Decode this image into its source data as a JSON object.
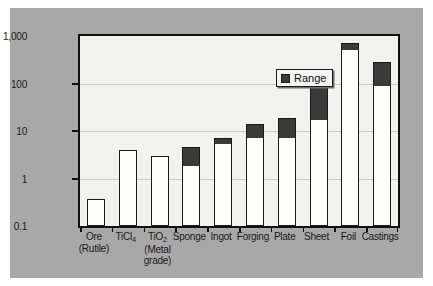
{
  "figure": {
    "background_color": "#a8a8a8",
    "plot_background_color": "#f2f2f0",
    "frame_color": "#111111"
  },
  "legend": {
    "label": "Range",
    "swatch_color": "#3a3a3a",
    "position": "top-center"
  },
  "chart_data": {
    "type": "bar",
    "title": "",
    "subtitle": "",
    "xlabel": "",
    "ylabel": "Log ($ per pound contained Ti)",
    "yscale": "log",
    "ylim": [
      0.1,
      1000
    ],
    "ytick_labels": [
      "1,000",
      "100",
      "10",
      "1",
      "0.1"
    ],
    "ytick_values": [
      1000,
      100,
      10,
      1,
      0.1
    ],
    "grid": true,
    "legend_entries": [
      "Range"
    ],
    "categories": [
      "Ore (Rutile)",
      "TiCl4",
      "TiO2 (Metal grade)",
      "Sponge",
      "Ingot",
      "Forging",
      "Plate",
      "Sheet",
      "Foil",
      "Castings"
    ],
    "category_labels": [
      {
        "line1": "Ore",
        "line2": "(Rutile)",
        "line3": ""
      },
      {
        "line1": "TiCl",
        "sub1": "4",
        "line2": "",
        "line3": ""
      },
      {
        "line1": "TiO",
        "sub1": "2",
        "line2": "(Metal",
        "line3": "grade)"
      },
      {
        "line1": "Sponge",
        "line2": "",
        "line3": ""
      },
      {
        "line1": "Ingot",
        "line2": "",
        "line3": ""
      },
      {
        "line1": "Forging",
        "line2": "",
        "line3": ""
      },
      {
        "line1": "Plate",
        "line2": "",
        "line3": ""
      },
      {
        "line1": "Sheet",
        "line2": "",
        "line3": ""
      },
      {
        "line1": "Foil",
        "line2": "",
        "line3": ""
      },
      {
        "line1": "Castings",
        "line2": "",
        "line3": ""
      }
    ],
    "series": [
      {
        "name": "Range",
        "low": [
          0.38,
          4.0,
          3.0,
          1.9,
          5.5,
          7.5,
          7.5,
          18,
          530,
          93
        ],
        "high": [
          0.38,
          4.0,
          3.0,
          4.7,
          7.2,
          14,
          19,
          100,
          700,
          290
        ]
      }
    ],
    "values": [
      0.38,
      4.0,
      3.0,
      4.7,
      7.2,
      14,
      19,
      100,
      700,
      290
    ]
  }
}
